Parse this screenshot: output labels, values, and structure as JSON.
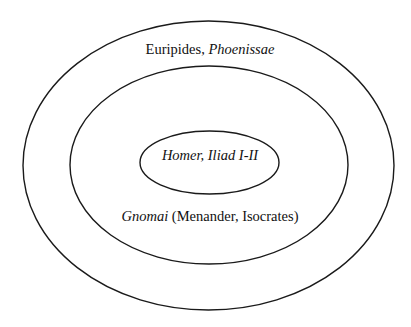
{
  "diagram": {
    "type": "nested-ellipses",
    "stroke_color": "#1a1a1a",
    "background": "#ffffff",
    "rings": [
      {
        "id": "outer",
        "cx": 208.5,
        "cy": 165.5,
        "rx": 185.5,
        "ry": 144.5,
        "label": {
          "parts": [
            {
              "text": "Euripides, ",
              "italic": false
            },
            {
              "text": "Phoenissae",
              "italic": true
            }
          ],
          "x": 210,
          "y": 54
        }
      },
      {
        "id": "middle",
        "cx": 209,
        "cy": 165,
        "rx": 139,
        "ry": 99,
        "label": {
          "parts": [
            {
              "text": "Gnomai",
              "italic": true
            },
            {
              "text": " (Menander, Isocrates)",
              "italic": false
            }
          ],
          "x": 210,
          "y": 221
        }
      },
      {
        "id": "inner",
        "cx": 209.5,
        "cy": 162.5,
        "rx": 69.5,
        "ry": 31.5,
        "label": {
          "parts": [
            {
              "text": "Homer, Iliad I-II",
              "italic": true
            }
          ],
          "x": 210,
          "y": 160
        }
      }
    ]
  }
}
